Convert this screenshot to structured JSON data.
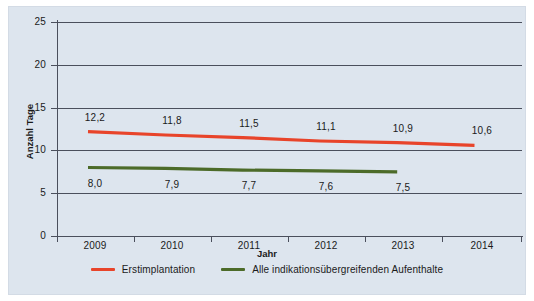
{
  "chart_data": {
    "type": "line",
    "title": "",
    "xlabel": "Jahr",
    "ylabel": "Anzahl Tage",
    "categories": [
      "2009",
      "2010",
      "2011",
      "2012",
      "2013",
      "2014"
    ],
    "ylim": [
      0,
      25
    ],
    "yticks": [
      "0",
      "5",
      "10",
      "15",
      "20",
      "25"
    ],
    "grid": true,
    "legend_position": "bottom",
    "series": [
      {
        "name": "Erstimplantation",
        "color": "#e8442a",
        "values": [
          12.2,
          11.8,
          11.5,
          11.1,
          10.9,
          10.6
        ],
        "labels": [
          "12,2",
          "11,8",
          "11,5",
          "11,1",
          "10,9",
          "10,6"
        ],
        "label_position": "above"
      },
      {
        "name": "Alle indikationsübergreifenden Aufenthalte",
        "color": "#4c6b29",
        "values": [
          8.0,
          7.9,
          7.7,
          7.6,
          7.5,
          null
        ],
        "labels": [
          "8,0",
          "7,9",
          "7,7",
          "7,6",
          "7,5"
        ],
        "label_position": "below"
      }
    ]
  },
  "axes": {
    "y_title": "Anzahl Tage",
    "x_title": "Jahr",
    "y_ticks": [
      "25",
      "20",
      "15",
      "10",
      "5",
      "0"
    ],
    "x_ticks": [
      "2009",
      "2010",
      "2011",
      "2012",
      "2013",
      "2014"
    ]
  },
  "data_labels": {
    "red": [
      "12,2",
      "11,8",
      "11,5",
      "11,1",
      "10,9",
      "10,6"
    ],
    "green": [
      "8,0",
      "7,9",
      "7,7",
      "7,6",
      "7,5"
    ]
  },
  "legend": {
    "items": [
      {
        "label": "Erstimplantation",
        "color": "#e8442a"
      },
      {
        "label": "Alle indikationsübergreifenden Aufenthalte",
        "color": "#4c6b29"
      }
    ]
  },
  "colors": {
    "background": "#dde5ee",
    "axis": "#4a4f5c",
    "series_red": "#e8442a",
    "series_green": "#4c6b29",
    "text": "#1a1a1a"
  }
}
